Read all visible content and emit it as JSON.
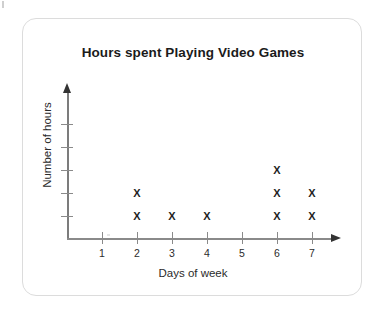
{
  "chart_data": {
    "type": "scatter",
    "title": "Hours spent Playing Video Games",
    "xlabel": "Days of week",
    "ylabel": "Number of hours",
    "marker": "X",
    "grid": false,
    "legend": null,
    "categories": [
      "1",
      "2",
      "3",
      "4",
      "5",
      "6",
      "7"
    ],
    "x": [
      1,
      2,
      3,
      4,
      5,
      6,
      7
    ],
    "values": [
      0,
      2,
      1,
      1,
      0,
      3,
      2
    ],
    "xlim": [
      0,
      8
    ],
    "ylim": [
      0,
      5
    ],
    "x_tick_labels": [
      "1",
      "2",
      "3",
      "4",
      "5",
      "6",
      "7"
    ],
    "y_tick_labels": [
      "",
      "",
      "",
      "",
      ""
    ],
    "y_tick_count": 5,
    "points": [
      {
        "day": 2,
        "hour": 1
      },
      {
        "day": 2,
        "hour": 2
      },
      {
        "day": 3,
        "hour": 1
      },
      {
        "day": 4,
        "hour": 1
      },
      {
        "day": 6,
        "hour": 1
      },
      {
        "day": 6,
        "hour": 2
      },
      {
        "day": 6,
        "hour": 3
      },
      {
        "day": 7,
        "hour": 1
      },
      {
        "day": 7,
        "hour": 2
      }
    ],
    "colors": {
      "marker": "#1f1f1f",
      "axis": "#8a8a8a",
      "title": "#1b1b1b",
      "card_border": "#dcdcdc",
      "background": "#ffffff"
    }
  }
}
